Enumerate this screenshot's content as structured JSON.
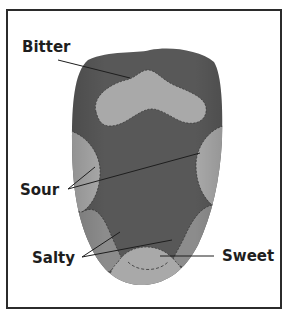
{
  "diagram": {
    "labels": {
      "bitter": "Bitter",
      "sour": "Sour",
      "salty": "Salty",
      "sweet": "Sweet"
    },
    "colors": {
      "tongue_dark": "#585858",
      "region_light": "#a9a9a9",
      "region_mid": "#8c8c8c",
      "border": "#2b2b2b",
      "leader_line": "#1e1e1e"
    }
  }
}
